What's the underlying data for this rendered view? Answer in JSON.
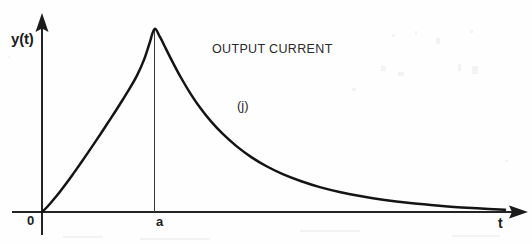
{
  "figure": {
    "width": 532,
    "height": 244,
    "background_color": "#fefefe",
    "ink_color": "#1c1c1c"
  },
  "labels": {
    "y_axis": "y(t)",
    "x_axis": "t",
    "origin": "0",
    "peak_tick": "a",
    "annotation_title": "OUTPUT CURRENT",
    "curve_name": "(j)"
  },
  "chart_data": {
    "type": "line",
    "title": "OUTPUT CURRENT",
    "xlabel": "t",
    "ylabel": "y(t)",
    "grid": false,
    "legend": "none",
    "axes": {
      "origin_label": "0",
      "x_tick_labels": [
        "0",
        "a"
      ],
      "y_tick_labels": [],
      "x_axis_arrow": true,
      "y_axis_arrow": true,
      "xlim": [
        0,
        1
      ],
      "ylim": [
        0,
        1.05
      ]
    },
    "annotations": [
      {
        "text": "OUTPUT CURRENT",
        "x": 0.35,
        "y": 0.92
      },
      {
        "text": "(j)",
        "x": 0.42,
        "y": 0.6
      }
    ],
    "markers": [
      {
        "name": "peak-dropline",
        "x_label": "a",
        "x": 0.243,
        "y_from": 0.0,
        "y_to": 1.0
      }
    ],
    "series": [
      {
        "name": "(j)",
        "description": "Output current: smooth rise from origin to a single peak at t = a, followed by exponential decay toward the t axis.",
        "peak": {
          "x_label": "a",
          "x": 0.243,
          "y": 1.0
        },
        "points": [
          [
            0.0,
            0.0
          ],
          [
            0.012,
            0.03
          ],
          [
            0.025,
            0.068
          ],
          [
            0.04,
            0.115
          ],
          [
            0.055,
            0.165
          ],
          [
            0.07,
            0.218
          ],
          [
            0.085,
            0.272
          ],
          [
            0.1,
            0.327
          ],
          [
            0.115,
            0.383
          ],
          [
            0.13,
            0.44
          ],
          [
            0.145,
            0.498
          ],
          [
            0.16,
            0.556
          ],
          [
            0.175,
            0.616
          ],
          [
            0.19,
            0.678
          ],
          [
            0.205,
            0.745
          ],
          [
            0.22,
            0.83
          ],
          [
            0.232,
            0.92
          ],
          [
            0.243,
            1.0
          ],
          [
            0.255,
            0.955
          ],
          [
            0.268,
            0.89
          ],
          [
            0.282,
            0.82
          ],
          [
            0.3,
            0.735
          ],
          [
            0.32,
            0.65
          ],
          [
            0.342,
            0.568
          ],
          [
            0.365,
            0.495
          ],
          [
            0.39,
            0.428
          ],
          [
            0.42,
            0.36
          ],
          [
            0.452,
            0.3
          ],
          [
            0.485,
            0.25
          ],
          [
            0.52,
            0.207
          ],
          [
            0.56,
            0.168
          ],
          [
            0.6,
            0.136
          ],
          [
            0.645,
            0.108
          ],
          [
            0.69,
            0.086
          ],
          [
            0.74,
            0.066
          ],
          [
            0.79,
            0.05
          ],
          [
            0.84,
            0.038
          ],
          [
            0.89,
            0.028
          ],
          [
            0.94,
            0.02
          ],
          [
            1.0,
            0.012
          ]
        ]
      }
    ]
  }
}
